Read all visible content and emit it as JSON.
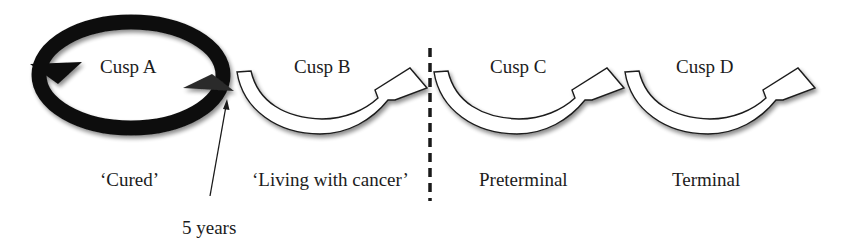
{
  "diagram": {
    "cusps": [
      {
        "id": "A",
        "label": "Cusp A",
        "phase": "‘Cured’",
        "style": "closed-loop",
        "color": "#111111"
      },
      {
        "id": "B",
        "label": "Cusp B",
        "phase": "‘Living with cancer’",
        "style": "open-curved-arrow",
        "color": "#ffffff"
      },
      {
        "id": "C",
        "label": "Cusp C",
        "phase": "Preterminal",
        "style": "open-curved-arrow",
        "color": "#ffffff"
      },
      {
        "id": "D",
        "label": "Cusp D",
        "phase": "Terminal",
        "style": "open-curved-arrow",
        "color": "#ffffff"
      }
    ],
    "annotation": {
      "label": "5 years",
      "points_to": "end of Cusp A loop"
    },
    "divider": {
      "style": "dashed",
      "position": "between Cusp B and Cusp C"
    },
    "colors": {
      "stroke": "#1a1a1a",
      "loop_fill": "#111111",
      "arrow_fill": "#ffffff",
      "background": "#ffffff"
    }
  }
}
